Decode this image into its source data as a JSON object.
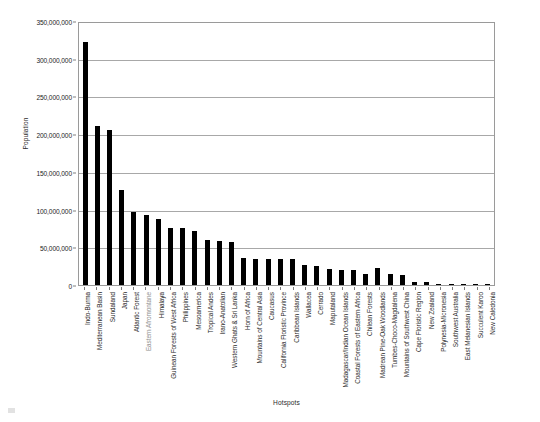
{
  "chart_data": {
    "type": "bar",
    "title": "",
    "xlabel": "Hotspots",
    "ylabel": "Population",
    "ylim": [
      0,
      350000000
    ],
    "ytick_step": 50000000,
    "grid": true,
    "legend": false,
    "bar_color": "#000000",
    "plot_border_color": "#9a9a9a",
    "gridline_color": "#a8a8a8",
    "ytick_labels": [
      "350,000,000",
      "300,000,000",
      "250,000,000",
      "200,000,000",
      "150,000,000",
      "100,000,000",
      "50,000,000",
      "0"
    ],
    "ytick_values": [
      350000000,
      300000000,
      250000000,
      200000000,
      150000000,
      100000000,
      50000000,
      0
    ],
    "categories": [
      "Indo-Burma",
      "Mediterranean Basin",
      "Sundaland",
      "Japan",
      "Atlantic Forest",
      "Eastern Afromontane",
      "Himalaya",
      "Guinean Forests of West Africa",
      "Philippines",
      "Mesoamerica",
      "Tropical Andes",
      "Irano-Anatolian",
      "Western Ghats & Sri Lanka",
      "Horn of Africa",
      "Mountains of Central Asia",
      "Caucasus",
      "California Floristic Province",
      "Caribbean Islands",
      "Wallacea",
      "Cerrado",
      "Maputaland",
      "Madagascar/Indian Ocean Islands",
      "Coastal Forests of Eastern Africa",
      "Chilean Forests",
      "Madrean Pine-Oak Woodlands",
      "Tumbes-Choco-Magdalena",
      "Mountains of Southwest China",
      "Cape Floristic Region",
      "New Zealand",
      "Polynesia-Micronesia",
      "Southwest Australia",
      "East Melanesian Islands",
      "Succulent Karoo",
      "New Caledonia"
    ],
    "dim_categories": [
      "Eastern Afromontane"
    ],
    "values": [
      322000000,
      211000000,
      205000000,
      126000000,
      97000000,
      93000000,
      87000000,
      76000000,
      75000000,
      72000000,
      60000000,
      58000000,
      57000000,
      36000000,
      35000000,
      35000000,
      35000000,
      34000000,
      26000000,
      25000000,
      21000000,
      20000000,
      20000000,
      15000000,
      23000000,
      14000000,
      13000000,
      4000000,
      4000000,
      2000000,
      2000000,
      1000000,
      1000000,
      300000
    ]
  }
}
